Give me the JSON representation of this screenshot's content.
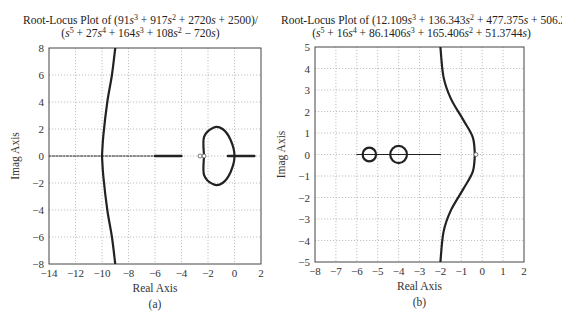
{
  "figure": {
    "panels": [
      {
        "id": "a",
        "caption": "(a)",
        "title_line1_prefix": "Root-Locus Plot of (91",
        "title_line2_prefix": "(",
        "xlabel": "Real Axis",
        "ylabel": "Imag Axis"
      },
      {
        "id": "b",
        "caption": "(b)",
        "xlabel": "Real Axis",
        "ylabel": "Imag Axis"
      }
    ]
  },
  "chart_data": [
    {
      "type": "line",
      "title": "Root-Locus Plot of (91s^3 + 917s^2 + 2720s + 2500)/(s^5 + 27s^4 + 164s^3 + 108s^2 - 720s)",
      "numerator": "91s^3 + 917s^2 + 2720s + 2500",
      "denominator": "s^5 + 27s^4 + 164s^3 + 108s^2 - 720s",
      "xlabel": "Real Axis",
      "ylabel": "Imag Axis",
      "caption": "(a)",
      "xlim": [
        -14,
        2
      ],
      "ylim": [
        -8,
        8
      ],
      "xticks": [
        -14,
        -12,
        -10,
        -8,
        -6,
        -4,
        -2,
        0,
        2
      ],
      "yticks": [
        -8,
        -6,
        -4,
        -2,
        0,
        2,
        4,
        6,
        8
      ],
      "grid": true,
      "branches": [
        {
          "name": "upper asymptote branch",
          "points": [
            [
              -10,
              0
            ],
            [
              -9.9,
              1.5
            ],
            [
              -9.6,
              4
            ],
            [
              -9.25,
              6
            ],
            [
              -9.0,
              8
            ]
          ]
        },
        {
          "name": "lower asymptote branch",
          "points": [
            [
              -10,
              0
            ],
            [
              -9.9,
              -1.5
            ],
            [
              -9.6,
              -4
            ],
            [
              -9.25,
              -6
            ],
            [
              -9.0,
              -8
            ]
          ]
        },
        {
          "name": "real-axis segment far left",
          "points": [
            [
              -14,
              0
            ],
            [
              -10,
              0
            ]
          ]
        },
        {
          "name": "real-axis segment",
          "points": [
            [
              -10,
              0
            ],
            [
              -6,
              0
            ]
          ]
        },
        {
          "name": "real-axis segment bold",
          "points": [
            [
              -6,
              0
            ],
            [
              -4,
              0
            ]
          ]
        },
        {
          "name": "closed loop",
          "points": [
            [
              -2.3,
              0
            ],
            [
              -2.3,
              1.4
            ],
            [
              -1.6,
              2.1
            ],
            [
              -0.9,
              2.0
            ],
            [
              -0.3,
              1.2
            ],
            [
              0.0,
              0
            ],
            [
              -0.3,
              -1.2
            ],
            [
              -0.9,
              -2.0
            ],
            [
              -1.6,
              -2.1
            ],
            [
              -2.3,
              -1.4
            ],
            [
              -2.3,
              0
            ]
          ]
        },
        {
          "name": "real-axis segment right",
          "points": [
            [
              -0.5,
              0
            ],
            [
              1.5,
              0
            ]
          ]
        }
      ],
      "zeros_markers": [
        [
          -2.6,
          0
        ],
        [
          -2.3,
          0
        ]
      ]
    },
    {
      "type": "line",
      "title": "Root-Locus Plot of (12.109s^3 + 136.343s^2 + 477.375s + 506.25)/(s^5 + 16s^4 + 86.1406s^3 + 165.406s^2 + 51.3744s)",
      "numerator": "12.109s^3 + 136.343s^2 + 477.375s + 506.25",
      "denominator": "s^5 + 16s^4 + 86.1406s^3 + 165.406s^2 + 51.3744s",
      "xlabel": "Real Axis",
      "ylabel": "Imag Axis",
      "caption": "(b)",
      "xlim": [
        -8,
        2
      ],
      "ylim": [
        -5,
        5
      ],
      "xticks": [
        -8,
        -7,
        -6,
        -5,
        -4,
        -3,
        -2,
        -1,
        0,
        1,
        2
      ],
      "yticks": [
        -5,
        -4,
        -3,
        -2,
        -1,
        0,
        1,
        2,
        3,
        4,
        5
      ],
      "grid": true,
      "branches": [
        {
          "name": "upper curve",
          "points": [
            [
              -0.35,
              0
            ],
            [
              -0.45,
              0.8
            ],
            [
              -0.9,
              1.6
            ],
            [
              -1.5,
              2.6
            ],
            [
              -1.85,
              3.6
            ],
            [
              -2.0,
              5
            ]
          ]
        },
        {
          "name": "lower curve",
          "points": [
            [
              -0.35,
              0
            ],
            [
              -0.45,
              -0.8
            ],
            [
              -0.9,
              -1.6
            ],
            [
              -1.5,
              -2.6
            ],
            [
              -1.85,
              -3.6
            ],
            [
              -2.0,
              -5
            ]
          ]
        },
        {
          "name": "real-axis segment",
          "points": [
            [
              -6.0,
              0
            ],
            [
              -2.0,
              0
            ]
          ]
        },
        {
          "name": "small circle",
          "center": [
            -5.4,
            0
          ],
          "radius": 0.32
        },
        {
          "name": "large circle",
          "center": [
            -4.0,
            0
          ],
          "radius": 0.4
        }
      ],
      "zeros_markers": [
        [
          -0.3,
          0
        ]
      ]
    }
  ]
}
